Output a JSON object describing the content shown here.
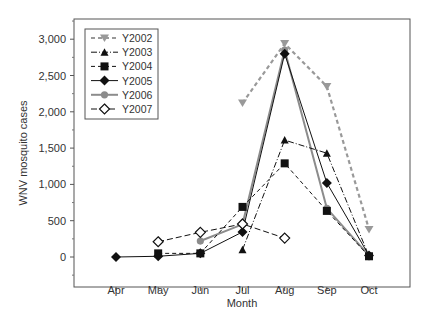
{
  "chart_data": {
    "type": "line",
    "title": "",
    "xlabel": "Month",
    "ylabel": "WNV mosquito cases",
    "categories": [
      "Apr",
      "May",
      "Jun",
      "Jul",
      "Aug",
      "Sep",
      "Oct"
    ],
    "ylim": [
      -250,
      3250
    ],
    "yticks": [
      0,
      500,
      1000,
      1500,
      2000,
      2500,
      3000
    ],
    "ytick_labels": [
      "0",
      "500",
      "1,000",
      "1,500",
      "2,000",
      "2,500",
      "3,000"
    ],
    "grid": false,
    "legend_position": "upper-left",
    "series": [
      {
        "name": "Y2002",
        "values": [
          null,
          null,
          null,
          2120,
          2940,
          2350,
          380
        ],
        "color": "#999999",
        "dash": "4,3",
        "marker": "triangle-down",
        "fill": "#999999",
        "width": 2.2
      },
      {
        "name": "Y2003",
        "values": [
          null,
          null,
          null,
          100,
          1610,
          1430,
          10
        ],
        "color": "#111111",
        "dash": "6,2,1,2",
        "marker": "triangle-up",
        "fill": "#111111",
        "width": 1
      },
      {
        "name": "Y2004",
        "values": [
          null,
          50,
          50,
          690,
          1290,
          635,
          10
        ],
        "color": "#111111",
        "dash": "4,3",
        "marker": "square",
        "fill": "#111111",
        "width": 1
      },
      {
        "name": "Y2005",
        "values": [
          0,
          10,
          50,
          345,
          2800,
          1020,
          20
        ],
        "color": "#111111",
        "dash": "",
        "marker": "diamond",
        "fill": "#111111",
        "width": 1
      },
      {
        "name": "Y2006",
        "values": [
          null,
          null,
          220,
          450,
          2850,
          670,
          20
        ],
        "color": "#8c8c8c",
        "dash": "",
        "marker": "circle",
        "fill": "#8c8c8c",
        "width": 2
      },
      {
        "name": "Y2007",
        "values": [
          null,
          210,
          340,
          455,
          260,
          null,
          null
        ],
        "color": "#111111",
        "dash": "6,3",
        "marker": "diamond-open",
        "fill": "#ffffff",
        "width": 1
      }
    ]
  }
}
